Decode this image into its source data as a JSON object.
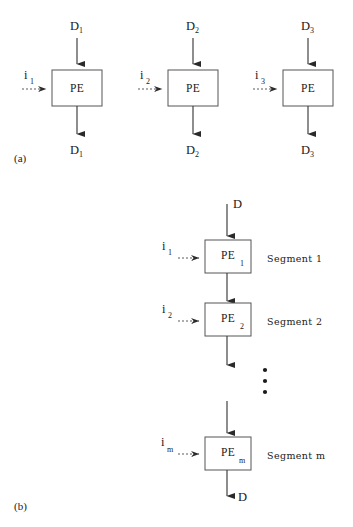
{
  "figure": {
    "top_strip_text": "",
    "panel_a": {
      "caption": "(a)",
      "units": [
        {
          "box_label": "PE",
          "top_input": "D",
          "top_input_sub": "1",
          "side_input": "i",
          "side_input_sub": "1",
          "output": "D",
          "output_sub": "1"
        },
        {
          "box_label": "PE",
          "top_input": "D",
          "top_input_sub": "2",
          "side_input": "i",
          "side_input_sub": "2",
          "output": "D",
          "output_sub": "2"
        },
        {
          "box_label": "PE",
          "top_input": "D",
          "top_input_sub": "3",
          "side_input": "i",
          "side_input_sub": "3",
          "output": "D",
          "output_sub": "3"
        }
      ]
    },
    "panel_b": {
      "caption": "(b)",
      "top_input": "D",
      "bottom_output": "D",
      "ellipsis_dots": 3,
      "stages": [
        {
          "box_label": "PE",
          "box_sub": "1",
          "side_input": "i",
          "side_input_sub": "1",
          "segment_label": "Segment 1"
        },
        {
          "box_label": "PE",
          "box_sub": "2",
          "side_input": "i",
          "side_input_sub": "2",
          "segment_label": "Segment 2"
        },
        {
          "box_label": "PE",
          "box_sub": "m",
          "side_input": "i",
          "side_input_sub": "m",
          "segment_label": "Segment m"
        }
      ]
    }
  },
  "colors": {
    "background": "#ffffff",
    "ink": "#1a1a1a",
    "box_stroke": "#555555",
    "line": "#3a3a3a"
  }
}
